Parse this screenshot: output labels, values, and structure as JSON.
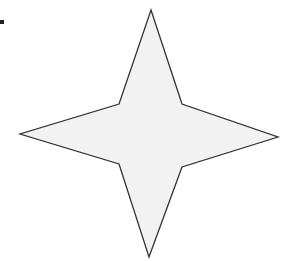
{
  "figure": {
    "shape": "four-pointed-star",
    "fill_color": "#f2f2f2",
    "stroke_color": "#333333",
    "background_color": "#ffffff",
    "mark_color": "#222222",
    "points": "151,10 182,104 278,137 182,167 149,257 119,164 20,134 119,104"
  }
}
